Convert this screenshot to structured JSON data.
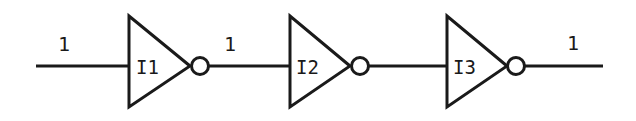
{
  "diagram": {
    "type": "logic-circuit",
    "gates": [
      {
        "id": "I1",
        "label": "I1",
        "type": "inverter"
      },
      {
        "id": "I2",
        "label": "I2",
        "type": "inverter"
      },
      {
        "id": "I3",
        "label": "I3",
        "type": "inverter"
      }
    ],
    "signals": [
      {
        "id": "input",
        "value": "1"
      },
      {
        "id": "I1-out",
        "value": "1"
      },
      {
        "id": "I2-out",
        "value": ""
      },
      {
        "id": "output",
        "value": "1"
      }
    ],
    "colors": {
      "stroke": "#1a1a1a",
      "background": "#ffffff"
    }
  }
}
